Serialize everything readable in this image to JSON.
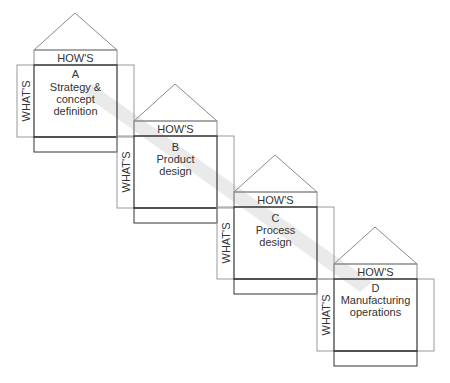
{
  "diagram": {
    "type": "cascading-house-of-quality",
    "band_color": "#e6e6e6",
    "line_color": "#333333",
    "frame_color": "#999999",
    "houses": [
      {
        "letter": "A",
        "title_lines": [
          "Strategy &",
          "concept",
          "definition"
        ],
        "hows_label": "HOW'S",
        "whats_label": "WHAT'S"
      },
      {
        "letter": "B",
        "title_lines": [
          "Product",
          "design"
        ],
        "hows_label": "HOW'S",
        "whats_label": "WHAT'S"
      },
      {
        "letter": "C",
        "title_lines": [
          "Process",
          "design"
        ],
        "hows_label": "HOW'S",
        "whats_label": "WHAT'S"
      },
      {
        "letter": "D",
        "title_lines": [
          "Manufacturing",
          "operations"
        ],
        "hows_label": "HOW'S",
        "whats_label": "WHAT'S"
      }
    ]
  }
}
